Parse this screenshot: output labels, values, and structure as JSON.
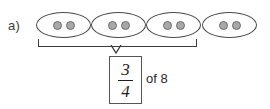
{
  "problem": {
    "item_label": "a)",
    "groups": [
      {
        "id": "group-1",
        "dot_count": 2,
        "in_bracket": true
      },
      {
        "id": "group-2",
        "dot_count": 2,
        "in_bracket": true
      },
      {
        "id": "group-3",
        "dot_count": 2,
        "in_bracket": true
      },
      {
        "id": "group-4",
        "dot_count": 2,
        "in_bracket": false
      }
    ],
    "fraction": {
      "numerator": "3",
      "denominator": "4"
    },
    "of_text": "of 8",
    "colors": {
      "dot_fill": "#a8a8a8",
      "dot_stroke": "#6e6e6e",
      "ellipse_stroke": "#4a4a4a",
      "bracket_stroke": "#3c3c3c",
      "box_stroke": "#555555",
      "text": "#2a2a2a",
      "background": "#ffffff"
    }
  }
}
